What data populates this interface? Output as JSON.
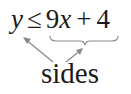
{
  "equation": {
    "lhs": "y",
    "relation": "≤",
    "coefficient": "9",
    "variable": "x",
    "plus": "+",
    "constant": "4"
  },
  "annotation": {
    "label": "sides",
    "arrow_color": "#8a8a8a",
    "brace_color": "#8a8a8a",
    "targets": [
      "left side: y",
      "right side: 9x + 4"
    ]
  },
  "colors": {
    "text": "#1a1a1a",
    "background": "#ffffff"
  }
}
